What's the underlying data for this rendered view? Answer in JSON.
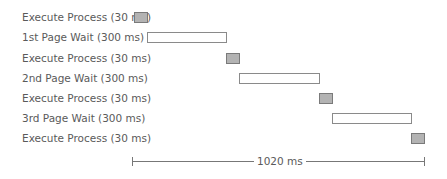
{
  "diagram": {
    "rows": [
      {
        "label": "Execute Process (30 ms)",
        "type": "exec",
        "start_ms": 0,
        "duration_ms": 30
      },
      {
        "label": "1st Page Wait (300 ms)",
        "type": "wait",
        "start_ms": 30,
        "duration_ms": 300
      },
      {
        "label": "Execute Process (30 ms)",
        "type": "exec",
        "start_ms": 330,
        "duration_ms": 30
      },
      {
        "label": "2nd Page Wait (300 ms)",
        "type": "wait",
        "start_ms": 360,
        "duration_ms": 300
      },
      {
        "label": "Execute Process (30 ms)",
        "type": "exec",
        "start_ms": 660,
        "duration_ms": 30
      },
      {
        "label": "3rd Page Wait (300 ms)",
        "type": "wait",
        "start_ms": 690,
        "duration_ms": 300
      },
      {
        "label": "Execute Process (30 ms)",
        "type": "exec",
        "start_ms": 990,
        "duration_ms": 30
      }
    ],
    "axis": {
      "label": "1020 ms",
      "total_ms": 1020
    }
  }
}
